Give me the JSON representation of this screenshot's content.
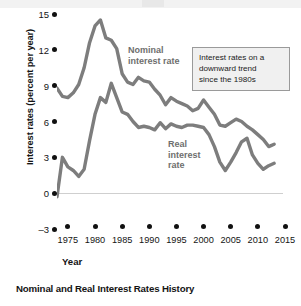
{
  "chart_data": {
    "type": "line",
    "title": "Nominal and Real Interest Rates History",
    "xlabel": "Year",
    "ylabel": "Interest rates (percent per year)",
    "xlim": [
      1973,
      2015
    ],
    "ylim": [
      -3,
      15
    ],
    "xticks": [
      1975,
      1980,
      1985,
      1990,
      1995,
      2000,
      2005,
      2010,
      2015
    ],
    "yticks": [
      -3,
      0,
      3,
      6,
      9,
      12,
      15
    ],
    "grid": false,
    "legend": "inline-labels",
    "zero_line": 0,
    "series": [
      {
        "name": "Nominal interest rate",
        "color": "#7d7d7d",
        "x": [
          1973,
          1974,
          1975,
          1976,
          1977,
          1978,
          1979,
          1980,
          1981,
          1982,
          1983,
          1984,
          1985,
          1986,
          1987,
          1988,
          1989,
          1990,
          1991,
          1992,
          1993,
          1994,
          1995,
          1996,
          1997,
          1998,
          1999,
          2000,
          2001,
          2002,
          2003,
          2004,
          2005,
          2006,
          2007,
          2008,
          2009,
          2010,
          2011,
          2012,
          2013
        ],
        "values": [
          8.8,
          8.1,
          8.0,
          8.4,
          9.1,
          10.5,
          12.6,
          14.0,
          14.5,
          13.0,
          12.8,
          12.1,
          10.0,
          9.3,
          9.1,
          9.7,
          9.4,
          9.3,
          8.7,
          8.2,
          7.4,
          8.0,
          7.7,
          7.5,
          7.3,
          6.9,
          7.1,
          7.8,
          7.2,
          6.6,
          5.7,
          5.6,
          5.9,
          6.2,
          6.0,
          5.6,
          5.3,
          4.9,
          4.5,
          3.9,
          4.1
        ]
      },
      {
        "name": "Real interest rate",
        "color": "#7d7d7d",
        "x": [
          1973,
          1974,
          1975,
          1976,
          1977,
          1978,
          1979,
          1980,
          1981,
          1982,
          1983,
          1984,
          1985,
          1986,
          1987,
          1988,
          1989,
          1990,
          1991,
          1992,
          1993,
          1994,
          1995,
          1996,
          1997,
          1998,
          1999,
          2000,
          2001,
          2002,
          2003,
          2004,
          2005,
          2006,
          2007,
          2008,
          2009,
          2010,
          2011,
          2012,
          2013
        ],
        "values": [
          -0.3,
          3.0,
          2.2,
          1.9,
          1.4,
          2.0,
          4.4,
          6.6,
          8.0,
          7.6,
          9.2,
          8.0,
          6.8,
          6.6,
          6.0,
          5.5,
          5.6,
          5.5,
          5.3,
          5.9,
          5.4,
          5.8,
          5.6,
          5.5,
          5.7,
          5.7,
          5.6,
          5.5,
          4.9,
          3.9,
          2.6,
          1.9,
          2.6,
          3.4,
          4.3,
          4.6,
          3.2,
          2.5,
          2.0,
          2.3,
          2.5
        ]
      }
    ],
    "annotations": [
      {
        "name": "nominal-series-label",
        "lines": [
          "Nominal",
          "interest rate"
        ]
      },
      {
        "name": "real-series-label",
        "lines": [
          "Real",
          "interest",
          "rate"
        ]
      },
      {
        "name": "trend-callout",
        "lines": [
          "Interest rates on a",
          "downward trend",
          "since the 1980s"
        ]
      }
    ]
  },
  "axes": {
    "y_title": "Interest rates (percent per year)",
    "x_title": "Year",
    "y_tick_labels": [
      "15",
      "12",
      "9",
      "6",
      "3",
      "0",
      "–3"
    ],
    "x_tick_labels": [
      "1975",
      "1980",
      "1985",
      "1990",
      "1995",
      "2000",
      "2005",
      "2010",
      "2015"
    ]
  },
  "labels": {
    "nominal_line1": "Nominal",
    "nominal_line2": "interest rate",
    "real_line1": "Real",
    "real_line2": "interest",
    "real_line3": "rate"
  },
  "callout": {
    "line1": "Interest rates on a",
    "line2": "downward trend",
    "line3": "since the 1980s"
  },
  "caption": "Nominal and Real Interest Rates History",
  "colors": {
    "line": "#7d7d7d",
    "text": "#141414",
    "annotation": "#6e6e6e",
    "callout_bg": "#f0f0f0",
    "callout_border": "#9a9a9a",
    "zero_line": "#cfcfcf"
  }
}
